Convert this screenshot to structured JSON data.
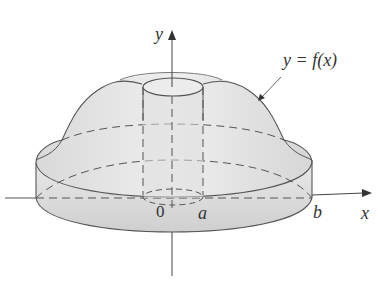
{
  "diagram": {
    "axes": {
      "x_label": "x",
      "y_label": "y",
      "origin_label": "0"
    },
    "curve_label": "y = f(x)",
    "x_marks": [
      "a",
      "b"
    ],
    "colors": {
      "stroke": "#555555",
      "fill": "#e4e4e4",
      "fill_dark": "#d2d2d2",
      "background": "#ffffff"
    }
  }
}
